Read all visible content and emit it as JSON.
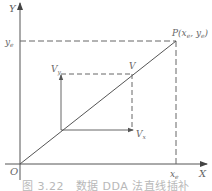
{
  "figure": {
    "caption": "图 3.22　数据 DDA 法直线插补",
    "axes": {
      "x_label": "X",
      "y_label": "Y",
      "origin_label": "O"
    },
    "endpoint": {
      "label": "P(x_e, y_e)",
      "label_main": "P(",
      "label_x": "x",
      "label_x_sub": "e",
      "label_sep": ", ",
      "label_y": "y",
      "label_y_sub": "e",
      "label_close": ")"
    },
    "x_tick": {
      "main": "x",
      "sub": "e"
    },
    "y_tick": {
      "main": "y",
      "sub": "e"
    },
    "velocity": {
      "v_label": "V",
      "vx_main": "V",
      "vx_sub": "x",
      "vy_main": "V",
      "vy_sub": "y"
    },
    "colors": {
      "line": "#555555",
      "dashed": "#666666",
      "text": "#666666"
    }
  }
}
